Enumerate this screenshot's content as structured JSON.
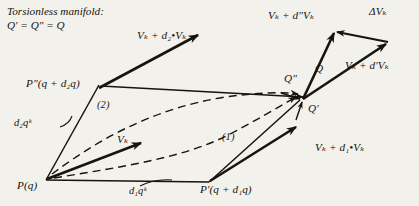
{
  "figure": {
    "title_line1": "Torsionless manifold:",
    "title_line2": "Q′ = Q″ = Q",
    "background_color": "#f3f1ec",
    "ink_color": "#17130f"
  },
  "points": {
    "origin": "P(q)",
    "first": "P′(q + d₁q)",
    "second": "P″(q + d₂q)"
  },
  "vectors": {
    "base": "Vₖ",
    "transported_along_2": "Vₖ + d₂•Vₖ",
    "transported_along_1": "Vₖ + d₁•Vₖ",
    "at_corner_double_prime": "Vₖ + d″Vₖ",
    "at_corner_prime": "Vₖ + d′Vₖ",
    "difference": "ΔVₖ"
  },
  "increments": {
    "d1": "d₁qᵏ",
    "d2": "d₂qᵏ"
  },
  "corner_labels": {
    "q_double_prime": "Q″",
    "q": "Q",
    "q_prime": "Q′"
  },
  "paths": {
    "path1": "(1)",
    "path2": "(2)"
  }
}
